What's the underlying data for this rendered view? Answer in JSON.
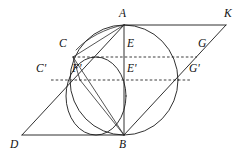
{
  "figure": {
    "canvas": {
      "width": 246,
      "height": 157,
      "background": "#ffffff"
    },
    "stroke_color": "#1a1a1a",
    "label_color": "#111111"
  },
  "points": [
    {
      "id": "A",
      "label": "A",
      "x": 124,
      "y": 25,
      "label_x": 119,
      "label_y": 8
    },
    {
      "id": "K",
      "label": "K",
      "x": 226,
      "y": 25,
      "label_x": 224,
      "label_y": 8
    },
    {
      "id": "B",
      "label": "B",
      "x": 124,
      "y": 135,
      "label_x": 119,
      "label_y": 139
    },
    {
      "id": "D",
      "label": "D",
      "x": 22,
      "y": 135,
      "label_x": 10,
      "label_y": 139
    },
    {
      "id": "C",
      "label": "C",
      "x": 73,
      "y": 57,
      "label_x": 59,
      "label_y": 38
    },
    {
      "id": "E",
      "label": "E",
      "x": 124,
      "y": 57,
      "label_x": 127,
      "label_y": 38
    },
    {
      "id": "G",
      "label": "G",
      "x": 197,
      "y": 57,
      "label_x": 198,
      "label_y": 38
    },
    {
      "id": "Cp",
      "label": "C'",
      "x": 51,
      "y": 80,
      "label_x": 36,
      "label_y": 63
    },
    {
      "id": "Fp",
      "label": "F'",
      "x": 80,
      "y": 80,
      "label_x": 72,
      "label_y": 63
    },
    {
      "id": "Ep",
      "label": "E'",
      "x": 124,
      "y": 80,
      "label_x": 127,
      "label_y": 63
    },
    {
      "id": "Gp",
      "label": "G'",
      "x": 190,
      "y": 80,
      "label_x": 189,
      "label_y": 63
    }
  ],
  "shapes": {
    "parallelogram": {
      "name": "parallelogram-D-A-K-B",
      "vertices": [
        "D",
        "A",
        "K",
        "B"
      ],
      "path": "M 22 135 L 124 25 L 226 25 L 124 135 Z"
    },
    "large_circle": {
      "name": "circle-through-A-and-B",
      "cx": 124,
      "cy": 80,
      "rx": 54,
      "ry": 55
    },
    "small_circle": {
      "name": "circle-through-C-Fprime-B",
      "cx": 96,
      "cy": 96,
      "rx": 30,
      "ry": 39
    },
    "arc_A_to_B_left": {
      "name": "arc-A-to-B-via-C",
      "path": "M 124 25 C 100 28 76 44 64 66 C 53 86 55 110 72 125 C 87 137 110 138 124 135"
    },
    "arc_A_to_B_right": {
      "name": "arc-from-A-curving-right-to-K-side",
      "path": "M 124 25 C 152 28 172 46 179 70 C 187 96 183 118 163 131 C 150 139 134 141 124 135"
    },
    "arc_D_to_A": {
      "name": "arc-outer-left-D-to-A",
      "path": "M 22 135 C 46 110 74 76 124 25"
    },
    "arc_B_to_K": {
      "name": "arc-outer-right-B-to-K",
      "path": "M 124 135 C 160 104 196 62 226 25"
    }
  },
  "segments": [
    {
      "name": "segment-D-to-A",
      "from": "D",
      "to": "A"
    },
    {
      "name": "segment-A-to-K",
      "from": "A",
      "to": "K"
    },
    {
      "name": "segment-K-to-B",
      "from": "K",
      "to": "B"
    },
    {
      "name": "segment-B-to-D",
      "from": "B",
      "to": "D"
    },
    {
      "name": "segment-A-to-B",
      "from": "A",
      "to": "B"
    },
    {
      "name": "segment-A-to-C",
      "from": "A",
      "to": "C"
    },
    {
      "name": "segment-C-to-B",
      "from": "C",
      "to": "B"
    },
    {
      "name": "segment-Fprime-to-B",
      "from": "Fp",
      "to": "B"
    },
    {
      "name": "segment-C-to-Fprime",
      "from": "C",
      "to": "Fp"
    }
  ],
  "dashed_lines": [
    {
      "name": "dashed-line-C-E-G",
      "x1": 73,
      "y1": 57,
      "x2": 197,
      "y2": 57,
      "through": [
        "C",
        "E",
        "G"
      ]
    },
    {
      "name": "dashed-line-Cprime-Fprime-Eprime-Gprime",
      "x1": 51,
      "y1": 80,
      "x2": 190,
      "y2": 80,
      "through": [
        "C'",
        "F'",
        "E'",
        "G'"
      ]
    }
  ]
}
